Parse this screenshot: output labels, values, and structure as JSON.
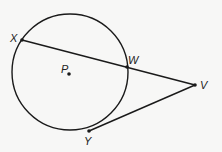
{
  "diagram": {
    "colors": {
      "background": "#f7f7f6",
      "stroke": "#1a1a1a"
    },
    "circle": {
      "center_label": "P",
      "cx": 70,
      "cy": 72,
      "r": 58
    },
    "points": [
      {
        "id": "X",
        "label": "X",
        "x": 22,
        "y": 40,
        "lx": 12,
        "ly": 38
      },
      {
        "id": "W",
        "label": "W",
        "x": 127,
        "y": 67,
        "lx": 128,
        "ly": 64
      },
      {
        "id": "V",
        "label": "V",
        "x": 195,
        "y": 85,
        "lx": 201,
        "ly": 89
      },
      {
        "id": "Y",
        "label": "Y",
        "x": 89,
        "y": 131,
        "lx": 84,
        "ly": 145
      },
      {
        "id": "P",
        "label": "P",
        "x": 69,
        "y": 74,
        "lx": 61,
        "ly": 72
      }
    ],
    "segments": [
      {
        "from": "X",
        "to": "V",
        "type": "secant"
      },
      {
        "from": "Y",
        "to": "V",
        "type": "tangent"
      }
    ]
  }
}
